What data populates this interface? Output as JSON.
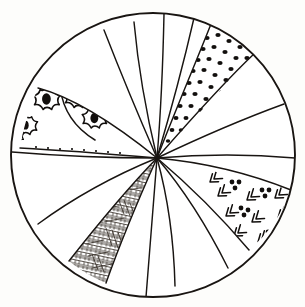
{
  "figure": {
    "label": "1.",
    "type": "line-drawing",
    "background_color": "#fdfdfb",
    "ink_color": "#191512"
  },
  "canvas": {
    "width": 305,
    "height": 307
  },
  "circle": {
    "center_x": 153,
    "center_y": 155,
    "radius": 143,
    "stroke_color": "#191512",
    "stroke_width": 1.9
  },
  "convergence_point": {
    "x": 157,
    "y": 158,
    "description": "all wedge dividing lines meet at this off-center point"
  },
  "wedges": {
    "count": 16,
    "description": "curved spiral segments radiating from the off-center convergence point to the circle rim",
    "boundaries_deg": [
      -96,
      -74,
      -52,
      -30,
      -10,
      12,
      34,
      56,
      78,
      100,
      122,
      142,
      168,
      196,
      222,
      250,
      264
    ]
  },
  "patterned_wedges": [
    {
      "id": "floral-rosette-wedge",
      "name": "floral rosette pattern",
      "position": "upper-left",
      "motif": "eight-petal flower rosettes with solid oval centers",
      "motif_count": 5
    },
    {
      "id": "dotted-wedge",
      "name": "dot field pattern",
      "position": "upper-right",
      "motif": "scattered round dots in staggered rows",
      "motif_count": 34
    },
    {
      "id": "chevron-dot-wedge",
      "name": "chevron and dot-cluster pattern",
      "position": "lower-right",
      "motif": "double chevron arrowheads with triangular dot clusters",
      "motif_count": 9
    },
    {
      "id": "crosshatch-wedge",
      "name": "cross-hatch scribble pattern",
      "position": "bottom-left-of-center",
      "motif": "dense short cross-hatched pen strokes",
      "motif_count": 60
    }
  ],
  "plain_wedges": {
    "count": 12,
    "fill": "#ffffff",
    "description": "undecorated blank segments"
  }
}
